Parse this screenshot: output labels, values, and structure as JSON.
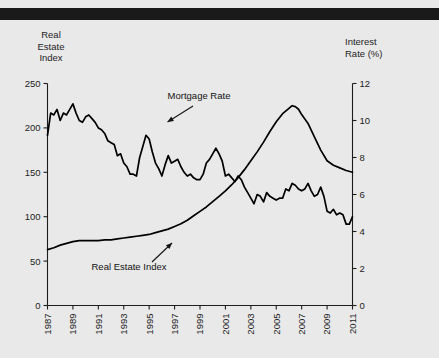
{
  "figure": {
    "background_color": "#e9e9e9",
    "rule_color": "#1a1a1a",
    "line_color": "#000000"
  },
  "left_axis_title": "Real\nEstate\nIndex",
  "right_axis_title": "Interest\nRate (%)",
  "chart_data": {
    "type": "line",
    "title": "",
    "subtitle": "",
    "xlabel": "",
    "ylabel": "Real Estate Index",
    "y2label": "Interest Rate (%)",
    "grid": false,
    "legend": "annotations-inline",
    "xlim": [
      1987,
      2011
    ],
    "ylim": [
      0,
      250
    ],
    "y2lim": [
      0,
      12
    ],
    "yticks": [
      0,
      50,
      100,
      150,
      200,
      250
    ],
    "y2ticks": [
      0,
      2,
      4,
      6,
      8,
      10,
      12
    ],
    "xticks": [
      1987,
      1989,
      1991,
      1993,
      1995,
      1997,
      1999,
      2001,
      2003,
      2005,
      2007,
      2009,
      2011
    ],
    "xticklabels": [
      "1987",
      "1989",
      "1991",
      "1993",
      "1995",
      "1997",
      "1999",
      "2001",
      "2003",
      "2005",
      "2007",
      "2009",
      "2011"
    ],
    "xtick_rotation": 90,
    "annotations": [
      {
        "text": "Mortgage Rate",
        "x": 1993.2,
        "y_axis": "right",
        "points_to_series": "Mortgage Rate"
      },
      {
        "text": "Real Estate Index",
        "x": 1992.0,
        "y_axis": "left",
        "points_to_series": "Real Estate Index"
      }
    ],
    "series": [
      {
        "name": "Mortgage Rate",
        "axis": "right",
        "units": "%",
        "x": [
          1987.0,
          1987.25,
          1987.5,
          1987.75,
          1988.0,
          1988.25,
          1988.5,
          1988.75,
          1989.0,
          1989.25,
          1989.5,
          1989.75,
          1990.0,
          1990.25,
          1990.5,
          1990.75,
          1991.0,
          1991.25,
          1991.5,
          1991.75,
          1992.0,
          1992.25,
          1992.5,
          1992.75,
          1993.0,
          1993.25,
          1993.5,
          1993.75,
          1994.0,
          1994.25,
          1994.5,
          1994.75,
          1995.0,
          1995.25,
          1995.5,
          1995.75,
          1996.0,
          1996.25,
          1996.5,
          1996.75,
          1997.0,
          1997.25,
          1997.5,
          1997.75,
          1998.0,
          1998.25,
          1998.5,
          1998.75,
          1999.0,
          1999.25,
          1999.5,
          1999.75,
          2000.0,
          2000.25,
          2000.5,
          2000.75,
          2001.0,
          2001.25,
          2001.5,
          2001.75,
          2002.0,
          2002.25,
          2002.5,
          2002.75,
          2003.0,
          2003.25,
          2003.5,
          2003.75,
          2004.0,
          2004.25,
          2004.5,
          2004.75,
          2005.0,
          2005.25,
          2005.5,
          2005.75,
          2006.0,
          2006.25,
          2006.5,
          2006.75,
          2007.0,
          2007.25,
          2007.5,
          2007.75,
          2008.0,
          2008.25,
          2008.5,
          2008.75,
          2009.0,
          2009.25,
          2009.5,
          2009.75,
          2010.0,
          2010.25,
          2010.5,
          2010.75,
          2011.0
        ],
        "values": [
          9.2,
          10.4,
          10.3,
          10.6,
          10.0,
          10.4,
          10.3,
          10.6,
          10.9,
          10.4,
          10.0,
          9.9,
          10.2,
          10.3,
          10.1,
          9.9,
          9.6,
          9.5,
          9.3,
          8.9,
          8.8,
          8.7,
          8.1,
          8.2,
          7.7,
          7.5,
          7.1,
          7.1,
          7.0,
          8.0,
          8.6,
          9.2,
          9.0,
          8.3,
          7.7,
          7.4,
          7.0,
          7.6,
          8.1,
          7.7,
          7.8,
          7.9,
          7.5,
          7.2,
          7.0,
          7.1,
          6.9,
          6.8,
          6.8,
          7.1,
          7.7,
          7.9,
          8.2,
          8.5,
          8.2,
          7.8,
          7.0,
          7.1,
          6.9,
          6.7,
          7.0,
          6.8,
          6.4,
          6.1,
          5.8,
          5.5,
          6.0,
          5.9,
          5.6,
          6.1,
          5.9,
          5.8,
          5.7,
          5.8,
          5.8,
          6.3,
          6.2,
          6.6,
          6.5,
          6.3,
          6.2,
          6.3,
          6.6,
          6.2,
          5.9,
          6.0,
          6.4,
          5.9,
          5.1,
          5.0,
          5.2,
          4.9,
          5.0,
          4.9,
          4.4,
          4.4,
          4.8
        ]
      },
      {
        "name": "Real Estate Index",
        "axis": "left",
        "units": "index",
        "x": [
          1987.0,
          1987.5,
          1988.0,
          1988.5,
          1989.0,
          1989.5,
          1990.0,
          1990.5,
          1991.0,
          1991.5,
          1992.0,
          1992.5,
          1993.0,
          1993.5,
          1994.0,
          1994.5,
          1995.0,
          1995.5,
          1996.0,
          1996.5,
          1997.0,
          1997.5,
          1998.0,
          1998.5,
          1999.0,
          1999.5,
          2000.0,
          2000.5,
          2001.0,
          2001.5,
          2002.0,
          2002.5,
          2003.0,
          2003.5,
          2004.0,
          2004.5,
          2005.0,
          2005.5,
          2006.0,
          2006.25,
          2006.5,
          2006.75,
          2007.0,
          2007.5,
          2008.0,
          2008.5,
          2009.0,
          2009.5,
          2010.0,
          2010.5,
          2011.0
        ],
        "values": [
          63,
          65,
          68,
          70,
          72,
          73,
          73,
          73,
          73,
          74,
          74,
          75,
          76,
          77,
          78,
          79,
          80,
          82,
          84,
          86,
          89,
          92,
          96,
          101,
          106,
          111,
          117,
          123,
          129,
          136,
          144,
          153,
          163,
          173,
          184,
          196,
          207,
          216,
          222,
          225,
          224,
          221,
          215,
          205,
          190,
          175,
          163,
          158,
          155,
          152,
          150
        ]
      }
    ]
  }
}
